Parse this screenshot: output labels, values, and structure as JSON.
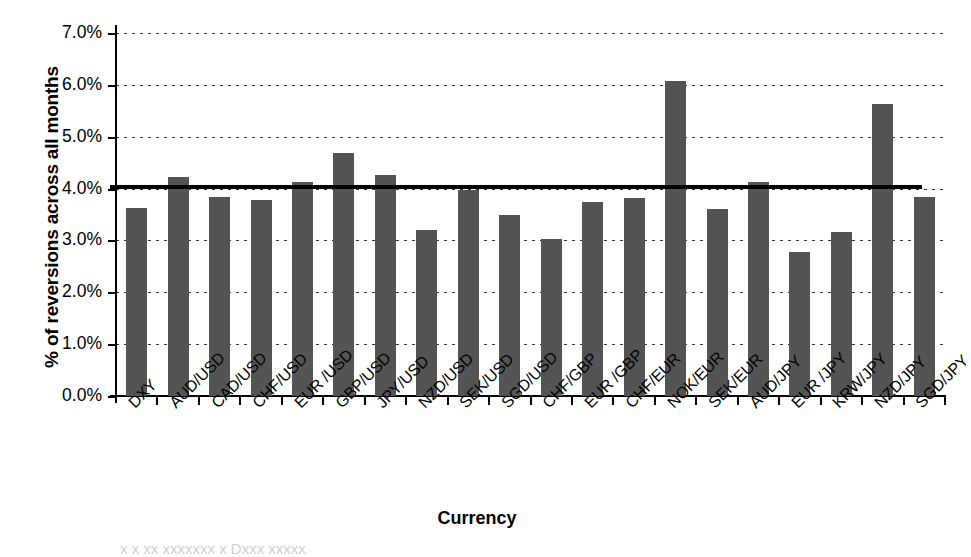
{
  "chart_data": {
    "type": "bar",
    "title": "",
    "xlabel": "Currency",
    "ylabel": "% of reversions across all months",
    "categories": [
      "DXY",
      "AUD/USD",
      "CAD/USD",
      "CHF/USD",
      "EUR /USD",
      "GBP/USD",
      "JPY/USD",
      "NZD/USD",
      "SEK/USD",
      "SGD/USD",
      "CHF/GBP",
      "EUR /GBP",
      "CHF/EUR",
      "NOK/EUR",
      "SEK/EUR",
      "AUD/JPY",
      "EUR /JPY",
      "KRW/JPY",
      "NZD/JPY",
      "SGD/JPY"
    ],
    "values": [
      3.63,
      4.22,
      3.83,
      3.78,
      4.13,
      4.68,
      4.26,
      3.2,
      3.98,
      3.5,
      3.03,
      3.75,
      3.82,
      6.08,
      3.61,
      4.12,
      2.78,
      3.17,
      5.63,
      3.84
    ],
    "value_unit": "%",
    "ylim": [
      0.0,
      7.0
    ],
    "ytick_values": [
      0.0,
      1.0,
      2.0,
      3.0,
      4.0,
      5.0,
      6.0,
      7.0
    ],
    "ytick_labels": [
      "0.0%",
      "1.0%",
      "2.0%",
      "3.0%",
      "4.0%",
      "5.0%",
      "6.0%",
      "7.0%"
    ],
    "grid": "horizontal-dotted",
    "legend": "none",
    "bar_color": "#545454",
    "reference_line": {
      "label": "average",
      "value": 4.03,
      "color": "#000000",
      "style": "solid"
    }
  },
  "bleed_text": "x x  xx  xxxxxxx  x  Dxxx xxxxx"
}
